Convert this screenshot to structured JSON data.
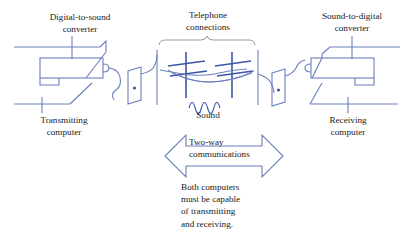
{
  "diagram": {
    "title_alt": "Two-way communication between computers over telephone lines",
    "colors": {
      "line": "#6a7fbd",
      "pole": "#3d56a6",
      "wire": "#6a7fbd",
      "brace": "#9a9a9a",
      "text": "#1a1a1a",
      "background": "#ffffff"
    },
    "labels": {
      "digital_to_sound": "Digital-to-sound\nconverter",
      "telephone_connections": "Telephone\nconnections",
      "sound_to_digital": "Sound-to-digital\nconverter",
      "transmitting_computer": "Transmitting\ncomputer",
      "receiving_computer": "Receiving\ncomputer",
      "sound": "Sound",
      "two_way": "Two-way\ncommunications",
      "note": "Both computers\nmust be capable\nof transmitting\nand receiving."
    },
    "elements": {
      "left_modem": "modem-box",
      "left_computer": "computer-outline",
      "left_jack": "wall-jack",
      "left_cable": "curly-cable",
      "pole_1": "telephone-pole",
      "pole_2": "telephone-pole",
      "sound_wave": "sine-wave",
      "right_jack": "wall-jack",
      "right_cable": "curly-cable",
      "right_modem": "modem-box",
      "right_computer": "computer-outline",
      "two_way_arrow": "double-headed-arrow",
      "brace": "curly-brace"
    }
  }
}
